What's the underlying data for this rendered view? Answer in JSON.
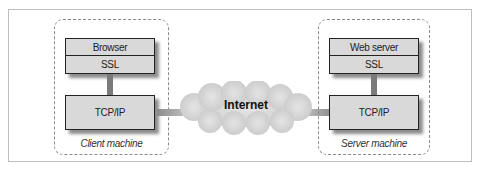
{
  "diagram": {
    "client": {
      "caption": "Client machine",
      "layers": [
        "Browser",
        "SSL"
      ],
      "transport": "TCP/IP"
    },
    "network": {
      "label": "Internet"
    },
    "server": {
      "caption": "Server machine",
      "layers": [
        "Web server",
        "SSL"
      ],
      "transport": "TCP/IP"
    },
    "colors": {
      "box_fill": "#d9d9d9",
      "cloud_fill": "#d4d4d4",
      "connector": "#7a7a7a"
    }
  }
}
